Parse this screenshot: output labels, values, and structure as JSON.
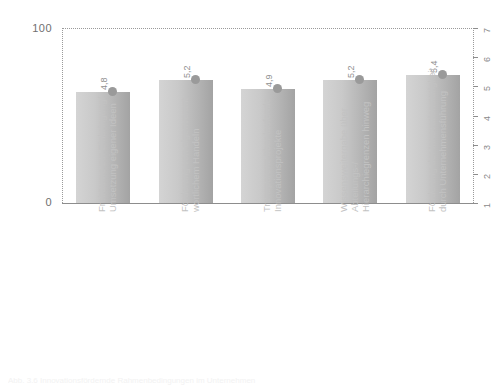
{
  "chart_data": {
    "type": "bar",
    "title": "",
    "xlabel": "",
    "ylabel": "",
    "categories": [
      "Freiräume zur Einbringung/ Umsetzung eigener Ideen",
      "Förderung von eigenverant- wortlichem Handeln",
      "Transparenz über laufende Innovationsprojekte",
      "Wissensweitergabe über Abteilungs-/ Hierarchiegrenzen hinweg",
      "Förderung der Innovationstätigkeit durch Unternehmensführung"
    ],
    "values": [
      4.8,
      5.2,
      4.9,
      5.2,
      5.4
    ],
    "value_labels": [
      "4,8",
      "5,2",
      "4,9",
      "5,2",
      "5,4"
    ],
    "ylim": [
      0,
      100
    ],
    "y_left_ticks": [
      "0",
      "100"
    ],
    "y_right_ticks": [
      "1",
      "2",
      "3",
      "4",
      "5",
      "6",
      "7"
    ],
    "y_right_lim": [
      1,
      7
    ],
    "grid": false,
    "legend": "none",
    "marker": "dot"
  },
  "axes": {
    "left": {
      "max_label": "100",
      "min_label": "0"
    },
    "right": {
      "ticks": [
        "7",
        "6",
        "5",
        "4",
        "3",
        "2",
        "1"
      ]
    }
  },
  "categories": [
    {
      "line1": "Freiräume zur Einbringung/",
      "line2": "Umsetzung eigener Ideen"
    },
    {
      "line1": "Förderung von eigenverant-",
      "line2": "wortlichem Handeln"
    },
    {
      "line1": "Transparenz über laufende",
      "line2": "Innovationsprojekte"
    },
    {
      "line1": "Wissensweitergabe über",
      "line2": "Abteilungs-/",
      "line3": "Hierarchiegrenzen hinweg"
    },
    {
      "line1": "Förderung der Innovationstätigkeit",
      "line2": "durch Unternehmensführung"
    }
  ],
  "bars": [
    {
      "label": "4,8"
    },
    {
      "label": "5,2"
    },
    {
      "label": "4,9"
    },
    {
      "label": "5,2"
    },
    {
      "label": "5,4"
    }
  ],
  "caption": {
    "text": "Abb. 3.6 Innovationsfördernde Rahmenbedingungen im Unternehmen"
  },
  "colors": {
    "bar_light": "#d4d4d4",
    "bar_dark": "#a3a3a3",
    "dot": "#9a9a9a",
    "axis": "#8d8d8d",
    "label": "#c2c2c2"
  }
}
